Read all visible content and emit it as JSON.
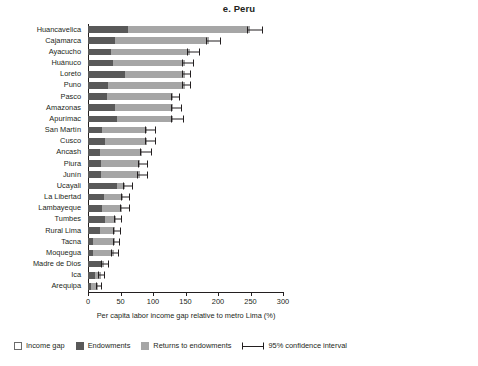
{
  "chart_data": {
    "type": "bar",
    "orientation": "horizontal",
    "stacked": true,
    "title": "e. Peru",
    "xlabel": "Per capita labor income gap relative to metro Lima (%)",
    "ylabel": "",
    "xlim": [
      0,
      300
    ],
    "xticks": [
      0,
      50,
      100,
      150,
      200,
      250,
      300
    ],
    "xticklabels": [
      "0",
      "50",
      "100",
      "150",
      "200",
      "250",
      "300"
    ],
    "grid": false,
    "legend_position": "bottom-left",
    "legend": [
      {
        "label": "Income gap",
        "color": "#ffffff",
        "style": "outlined-box"
      },
      {
        "label": "Endowments",
        "color": "#595959",
        "style": "filled-box"
      },
      {
        "label": "Returns to endowments",
        "color": "#a6a6a6",
        "style": "filled-box"
      },
      {
        "label": "95% confidence interval",
        "color": "#231f20",
        "style": "whisker-line"
      }
    ],
    "categories": [
      "Huancavelica",
      "Cajamarca",
      "Ayacucho",
      "Huánuco",
      "Loreto",
      "Puno",
      "Pasco",
      "Amazonas",
      "Apurímac",
      "San Martín",
      "Cusco",
      "Ancash",
      "Piura",
      "Junín",
      "Ucayali",
      "La Libertad",
      "Lambayeque",
      "Tumbes",
      "Rural Lima",
      "Tacna",
      "Moquegua",
      "Madre de Dios",
      "Ica",
      "Arequipa"
    ],
    "series": [
      {
        "name": "Endowments",
        "color": "#595959",
        "values": [
          62,
          42,
          36,
          38,
          57,
          31,
          29,
          41,
          45,
          22,
          26,
          19,
          20,
          20,
          44,
          24,
          22,
          26,
          19,
          7,
          7,
          20,
          11,
          4
        ]
      },
      {
        "name": "Returns to endowments",
        "color": "#a6a6a6",
        "values": [
          187,
          144,
          121,
          111,
          92,
          118,
          102,
          90,
          86,
          69,
          65,
          64,
          60,
          60,
          13,
          30,
          31,
          17,
          22,
          35,
          33,
          4,
          9,
          12
        ]
      }
    ],
    "income_gap_totals": [
      249,
      186,
      157,
      149,
      149,
      149,
      131,
      131,
      131,
      91,
      91,
      83,
      80,
      80,
      57,
      54,
      53,
      43,
      41,
      42,
      40,
      24,
      20,
      16
    ],
    "confidence_intervals": [
      {
        "category": "Huancavelica",
        "low": 244,
        "high": 270
      },
      {
        "category": "Cajamarca",
        "low": 181,
        "high": 205
      },
      {
        "category": "Ayacucho",
        "low": 152,
        "high": 172
      },
      {
        "category": "Huánuco",
        "low": 145,
        "high": 163
      },
      {
        "category": "Loreto",
        "low": 145,
        "high": 158
      },
      {
        "category": "Puno",
        "low": 144,
        "high": 159
      },
      {
        "category": "Pasco",
        "low": 127,
        "high": 142
      },
      {
        "category": "Amazonas",
        "low": 128,
        "high": 145
      },
      {
        "category": "Apurímac",
        "low": 127,
        "high": 148
      },
      {
        "category": "San Martín",
        "low": 88,
        "high": 105
      },
      {
        "category": "Cusco",
        "low": 88,
        "high": 104
      },
      {
        "category": "Ancash",
        "low": 80,
        "high": 98
      },
      {
        "category": "Piura",
        "low": 77,
        "high": 92
      },
      {
        "category": "Junín",
        "low": 76,
        "high": 92
      },
      {
        "category": "Ucayali",
        "low": 54,
        "high": 69
      },
      {
        "category": "La Libertad",
        "low": 50,
        "high": 64
      },
      {
        "category": "Lambayeque",
        "low": 49,
        "high": 64
      },
      {
        "category": "Tumbes",
        "low": 40,
        "high": 53
      },
      {
        "category": "Rural Lima",
        "low": 38,
        "high": 51
      },
      {
        "category": "Tacna",
        "low": 38,
        "high": 49
      },
      {
        "category": "Moquegua",
        "low": 36,
        "high": 47
      },
      {
        "category": "Madre de Dios",
        "low": 20,
        "high": 33
      },
      {
        "category": "Ica",
        "low": 16,
        "high": 26
      },
      {
        "category": "Arequipa",
        "low": 12,
        "high": 22
      }
    ]
  }
}
